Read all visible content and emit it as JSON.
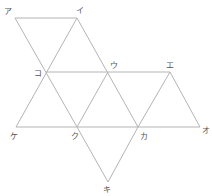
{
  "diagram": {
    "type": "triangle-net",
    "stroke_color": "#b4b4b4",
    "label_color": "#555555",
    "vertices": [
      {
        "id": "a",
        "label": "ア",
        "x": 15,
        "y": 18,
        "lx": 4,
        "ly": 14
      },
      {
        "id": "i",
        "label": "イ",
        "x": 77,
        "y": 18,
        "lx": 76,
        "ly": 13
      },
      {
        "id": "ko",
        "label": "コ",
        "x": 46,
        "y": 72,
        "lx": 34,
        "ly": 76
      },
      {
        "id": "u",
        "label": "ウ",
        "x": 108,
        "y": 72,
        "lx": 110,
        "ly": 68
      },
      {
        "id": "e",
        "label": "エ",
        "x": 170,
        "y": 72,
        "lx": 166,
        "ly": 68
      },
      {
        "id": "ke",
        "label": "ケ",
        "x": 16,
        "y": 127,
        "lx": 10,
        "ly": 139
      },
      {
        "id": "ku",
        "label": "ク",
        "x": 77,
        "y": 127,
        "lx": 71,
        "ly": 139
      },
      {
        "id": "ka",
        "label": "カ",
        "x": 138,
        "y": 127,
        "lx": 140,
        "ly": 139
      },
      {
        "id": "o",
        "label": "オ",
        "x": 200,
        "y": 127,
        "lx": 202,
        "ly": 133
      },
      {
        "id": "ki",
        "label": "キ",
        "x": 108,
        "y": 182,
        "lx": 103,
        "ly": 192
      }
    ],
    "edges": [
      [
        "a",
        "i"
      ],
      [
        "a",
        "ku"
      ],
      [
        "i",
        "ke"
      ],
      [
        "i",
        "ka"
      ],
      [
        "ko",
        "e"
      ],
      [
        "ke",
        "o"
      ],
      [
        "u",
        "ku"
      ],
      [
        "e",
        "ka"
      ],
      [
        "e",
        "o"
      ],
      [
        "ku",
        "ki"
      ],
      [
        "ka",
        "ki"
      ]
    ]
  }
}
